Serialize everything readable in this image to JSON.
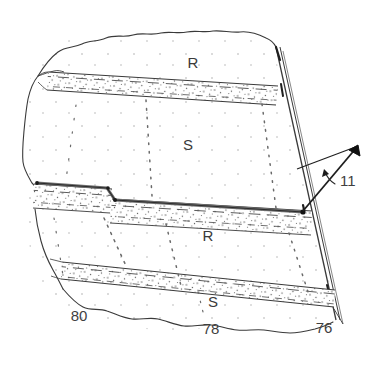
{
  "figure": {
    "background_color": "#ffffff",
    "line_color": "#3a3a3a",
    "seam_color": "#6b6b6b",
    "stipple_color": "#5a5a5a",
    "dash_color": "#555555"
  },
  "lithology_labels": [
    {
      "name": "rock-label-upper",
      "text": "R",
      "x": 193,
      "y": 68,
      "size": 15
    },
    {
      "name": "shale-label-upper",
      "text": "S",
      "x": 188,
      "y": 150,
      "size": 15
    },
    {
      "name": "rock-label-lower",
      "text": "R",
      "x": 208,
      "y": 241,
      "size": 15
    },
    {
      "name": "shale-label-lower",
      "text": "S",
      "x": 213,
      "y": 307,
      "size": 15
    }
  ],
  "reference_numerals": [
    {
      "name": "ref-numeral-11",
      "text": "11",
      "x": 340,
      "y": 186,
      "size": 15
    },
    {
      "name": "ref-numeral-80",
      "text": "80",
      "x": 79,
      "y": 321,
      "size": 15
    },
    {
      "name": "ref-numeral-78",
      "text": "78",
      "x": 211,
      "y": 334,
      "size": 15
    },
    {
      "name": "ref-numeral-76",
      "text": "76",
      "x": 324,
      "y": 333,
      "size": 15
    }
  ],
  "legend_meaning": {
    "R": "rock layer",
    "S": "shale layer"
  }
}
